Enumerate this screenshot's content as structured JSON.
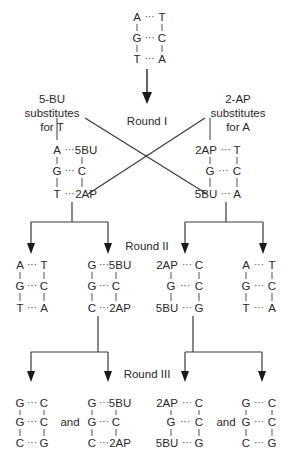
{
  "rounds": {
    "r1": "Round I",
    "r2": "Round II",
    "r3": "Round III"
  },
  "labels": {
    "left": [
      "5-BU",
      "substitutes",
      "for T"
    ],
    "right": [
      "2-AP",
      "substitutes",
      "for A"
    ]
  },
  "and_word": "and",
  "dots": "···",
  "duplexes": {
    "original": [
      [
        "A",
        "T"
      ],
      [
        "G",
        "C"
      ],
      [
        "T",
        "A"
      ]
    ],
    "r1_left": [
      [
        "A",
        "5BU"
      ],
      [
        "G",
        "C"
      ],
      [
        "T",
        "2AP"
      ]
    ],
    "r1_right": [
      [
        "2AP",
        "T"
      ],
      [
        "G",
        "C"
      ],
      [
        "5BU",
        "A"
      ]
    ],
    "r2_a": [
      [
        "A",
        "T"
      ],
      [
        "G",
        "C"
      ],
      [
        "T",
        "A"
      ]
    ],
    "r2_b": [
      [
        "G",
        "5BU"
      ],
      [
        "G",
        "C"
      ],
      [
        "C",
        "2AP"
      ]
    ],
    "r2_c": [
      [
        "2AP",
        "C"
      ],
      [
        "G",
        "C"
      ],
      [
        "5BU",
        "G"
      ]
    ],
    "r2_d": [
      [
        "A",
        "T"
      ],
      [
        "G",
        "C"
      ],
      [
        "T",
        "A"
      ]
    ],
    "r3_a": [
      [
        "G",
        "C"
      ],
      [
        "G",
        "C"
      ],
      [
        "C",
        "G"
      ]
    ],
    "r3_b": [
      [
        "G",
        "5BU"
      ],
      [
        "G",
        "C"
      ],
      [
        "C",
        "2AP"
      ]
    ],
    "r3_c": [
      [
        "2AP",
        "C"
      ],
      [
        "G",
        "C"
      ],
      [
        "5BU",
        "G"
      ]
    ],
    "r3_d": [
      [
        "G",
        "C"
      ],
      [
        "G",
        "C"
      ],
      [
        "C",
        "G"
      ]
    ]
  },
  "colors": {
    "text": "#2a2a2a",
    "line": "#3a3a3a",
    "background": "#ffffff"
  }
}
